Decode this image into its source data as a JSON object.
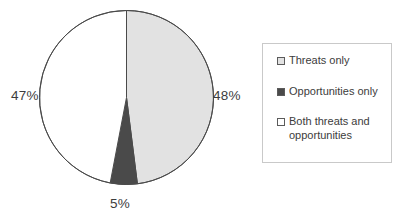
{
  "chart_data": {
    "type": "pie",
    "title": "",
    "categories": [
      "Threats only",
      "Opportunities only",
      "Both threats and opportunities"
    ],
    "values": [
      48,
      5,
      47
    ],
    "value_labels": [
      "48%",
      "5%",
      "47%"
    ],
    "units": "percent",
    "start_angle_deg": 0,
    "direction": "clockwise",
    "legend_position": "right",
    "grid": false,
    "slice_colors": [
      "#e2e2e2",
      "#4a4a4a",
      "#ffffff"
    ],
    "slice_border_color": "#4a4a4a",
    "slices": [
      {
        "label": "Threats only",
        "value": 48,
        "display": "48%",
        "color": "#e2e2e2"
      },
      {
        "label": "Opportunities only",
        "value": 5,
        "display": "5%",
        "color": "#4a4a4a"
      },
      {
        "label": "Both threats and opportunities",
        "value": 47,
        "display": "47%",
        "color": "#ffffff"
      }
    ]
  },
  "pie": {
    "label_right": "48%",
    "label_bottom": "5%",
    "label_left": "47%"
  },
  "legend": {
    "items": [
      {
        "label": "Threats only",
        "swatch_color": "#e2e2e2"
      },
      {
        "label": "Opportunities only",
        "swatch_color": "#4a4a4a"
      },
      {
        "label": "Both threats and opportunities",
        "swatch_color": "#ffffff"
      }
    ]
  },
  "colors": {
    "threats_only": "#e2e2e2",
    "opportunities_only": "#4a4a4a",
    "both": "#ffffff",
    "outline": "#4a4a4a",
    "legend_border": "#c9c9c9",
    "text": "#3c3c3c"
  }
}
